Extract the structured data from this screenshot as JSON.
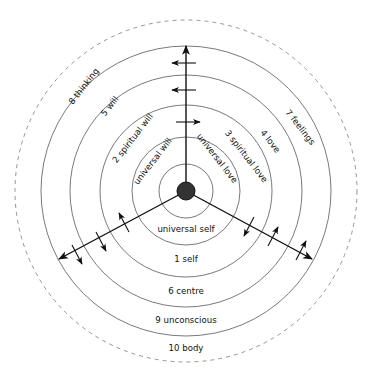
{
  "diagram": {
    "center": {
      "x": 186,
      "y": 191
    },
    "hub_radius": 9,
    "rings": [
      27,
      54,
      86,
      116,
      145
    ],
    "outer_dashed_radius": 171,
    "colors": {
      "ring": "#6a6a6a",
      "axis": "#111111",
      "hub": "#333333"
    },
    "labels": {
      "universal_will": "universal will",
      "spiritual_will": "2 spiritual will",
      "will": "5 will",
      "thinking": "8 thinking",
      "universal_love": "universal love",
      "spiritual_love": "3 spiritual love",
      "love": "4 love",
      "feelings": "7 feelings",
      "universal_self": "universal self",
      "self": "1 self",
      "centre": "6 centre",
      "unconscious": "9 unconscious",
      "body": "10 body"
    },
    "axes": [
      {
        "name": "vertical",
        "end": [
          186,
          45
        ],
        "cross_arrows": [
          {
            "at": 63,
            "dir": "left"
          },
          {
            "at": 90,
            "dir": "left"
          },
          {
            "at": 122,
            "dir": "right"
          }
        ]
      },
      {
        "name": "lower-left",
        "end": [
          58,
          260
        ],
        "cross_arrows": [
          "up",
          "down",
          "down"
        ]
      },
      {
        "name": "lower-right",
        "end": [
          313,
          260
        ],
        "cross_arrows": [
          "down",
          "up",
          "up"
        ]
      }
    ]
  }
}
